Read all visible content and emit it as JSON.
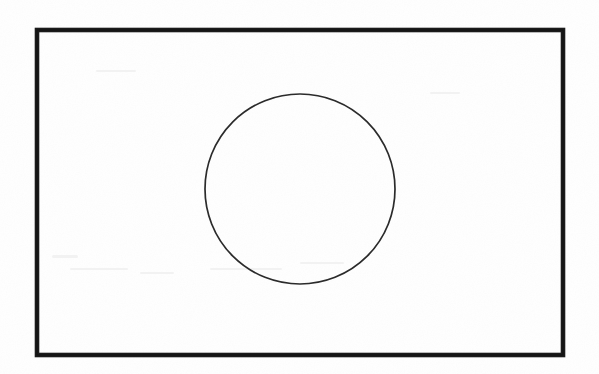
{
  "document": {
    "kind": "scanned-line-drawing",
    "title": "",
    "caption": "",
    "canvas": {
      "width": 599,
      "height": 374
    },
    "background_color": "#fefefe",
    "page_margin_color": "#ffffff"
  },
  "figure": {
    "name": "rectangle-with-inscribed-circle",
    "label": "",
    "shapes": [
      {
        "id": "outer-rectangle",
        "type": "rectangle",
        "label": "",
        "x": 37,
        "y": 30,
        "width": 526,
        "height": 325,
        "stroke_color": "#1b1b1b",
        "stroke_width": 4.6,
        "fill": "none"
      },
      {
        "id": "inner-circle",
        "type": "circle",
        "label": "",
        "center_x": 300,
        "center_y": 189,
        "radius": 95,
        "stroke_color": "#2b2b2b",
        "stroke_width": 1.7,
        "fill": "none"
      }
    ]
  },
  "annotations": {
    "text_items": [],
    "dimension_labels": [],
    "notes": ""
  }
}
